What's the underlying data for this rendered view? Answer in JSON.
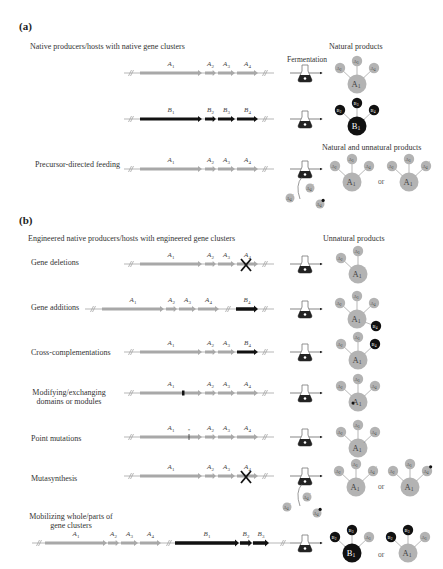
{
  "panels": {
    "a": {
      "label": "(a)",
      "section_title": "Native producers/hosts with native gene clusters",
      "products_title": "Natural products",
      "fermentation_label": "Fermentation",
      "feeding_products_title": "Natural and unnatural products",
      "rows": [
        {
          "label": "",
          "genes": [
            "A1",
            "A2",
            "A3",
            "A4"
          ],
          "cluster": "A"
        },
        {
          "label": "",
          "genes": [
            "B1",
            "B2",
            "B3",
            "B4"
          ],
          "cluster": "B"
        },
        {
          "label": "Precursor-directed feeding",
          "genes": [
            "A1",
            "A2",
            "A3",
            "A4"
          ],
          "cluster": "A",
          "or_label": "or"
        }
      ]
    },
    "b": {
      "label": "(b)",
      "section_title": "Engineered native producers/hosts with engineered gene clusters",
      "products_title": "Unnatural products",
      "rows": [
        {
          "label": "Gene deletions",
          "genes": [
            "A1",
            "A2",
            "A3",
            "A4"
          ],
          "modification": "deletion of A4"
        },
        {
          "label": "Gene additions",
          "genes": [
            "A1",
            "A2",
            "A3",
            "A4",
            "B4"
          ],
          "modification": "addition of B4"
        },
        {
          "label": "Cross-complementations",
          "genes": [
            "A1",
            "A2",
            "A3",
            "B4"
          ],
          "modification": "A4 replaced by B4"
        },
        {
          "label": "Modifying/exchanging domains or modules",
          "genes": [
            "A1",
            "A2",
            "A3",
            "A4"
          ],
          "modification": "domain swap in A1"
        },
        {
          "label": "Point mutations",
          "genes": [
            "A1",
            "A2",
            "A3",
            "A4"
          ],
          "modification": "point mutation in A1 (*)"
        },
        {
          "label": "Mutasynthesis",
          "genes": [
            "A1",
            "A2",
            "A3",
            "A4"
          ],
          "modification": "deletion of A4 + feeding",
          "or_label": "or"
        },
        {
          "label": "Mobilizing whole/parts of gene clusters",
          "genes": [
            "A1",
            "A2",
            "A3",
            "A4",
            "B1",
            "B2",
            "B3"
          ],
          "modification": "B cluster mobilized",
          "or_label": "or"
        }
      ]
    }
  },
  "colors": {
    "gene_a": "#a8a8a8",
    "gene_b": "#111111",
    "product_a": "#b3b3b3",
    "product_b": "#111111",
    "line": "#999999",
    "text": "#333333"
  }
}
